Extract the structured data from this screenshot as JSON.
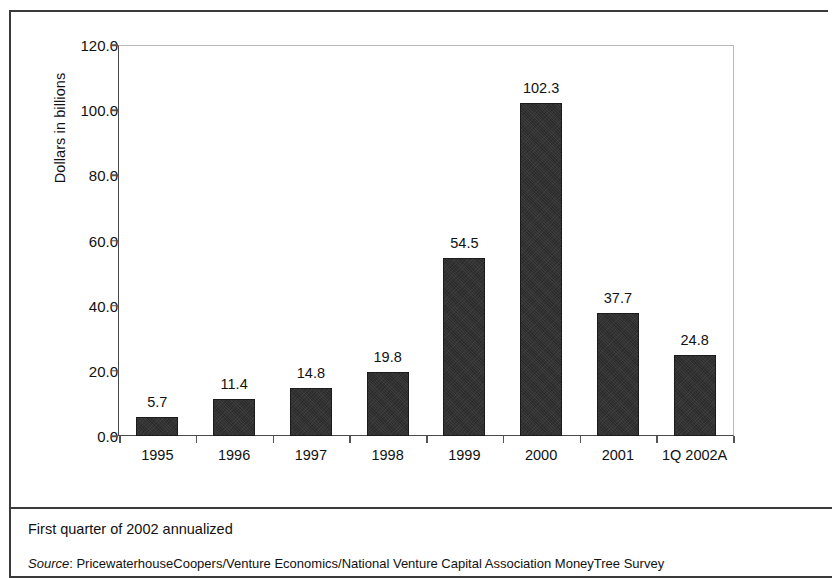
{
  "frame": {
    "border_color": "#3a3a3a"
  },
  "chart_data": {
    "type": "bar",
    "title": "",
    "subtitle": "",
    "xlabel": "",
    "ylabel": "Dollars in billions",
    "categories": [
      "1995",
      "1996",
      "1997",
      "1998",
      "1999",
      "2000",
      "2001",
      "1Q 2002A"
    ],
    "values": [
      5.7,
      11.4,
      14.8,
      19.8,
      54.5,
      102.3,
      37.7,
      24.8
    ],
    "data_labels": [
      "5.7",
      "11.4",
      "14.8",
      "19.8",
      "54.5",
      "102.3",
      "37.7",
      "24.8"
    ],
    "ylim": [
      0.0,
      120.0
    ],
    "ytick_values": [
      120.0,
      100.0,
      80.0,
      60.0,
      40.0,
      20.0,
      0.0
    ],
    "ytick_labels": [
      "120.0",
      "100.0",
      "80.0",
      "60.0",
      "40.0",
      "20.0",
      "0.0"
    ],
    "ytick_step": 20.0,
    "grid": false,
    "legend": false,
    "legend_position": "none",
    "bar_color": "#2b2b2b",
    "axis_color": "#4a4a4a"
  },
  "footer": {
    "footnote": "First quarter of 2002 annualized",
    "source_label": "Source",
    "source_separator": ": ",
    "source_text": "PricewaterhouseCoopers/Venture Economics/National Venture Capital Association MoneyTree Survey"
  }
}
